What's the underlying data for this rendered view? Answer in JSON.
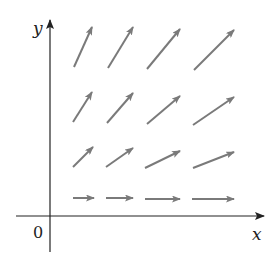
{
  "diagram": {
    "type": "vector-field",
    "labels": {
      "x_axis": "x",
      "y_axis": "y",
      "origin": "0"
    },
    "colors": {
      "axis": "#222222",
      "arrow": "#7a7a7a",
      "background": "#ffffff"
    },
    "axes": {
      "x_axis": {
        "x1": 16,
        "y1": 216,
        "x2": 264,
        "y2": 216
      },
      "y_axis": {
        "x1": 50,
        "y1": 252,
        "x2": 50,
        "y2": 20
      }
    },
    "arrows": [
      {
        "row": 1,
        "col": 1,
        "x1": 73,
        "y1": 198,
        "x2": 94,
        "y2": 198
      },
      {
        "row": 1,
        "col": 2,
        "x1": 106,
        "y1": 198,
        "x2": 133,
        "y2": 198
      },
      {
        "row": 1,
        "col": 3,
        "x1": 145,
        "y1": 199,
        "x2": 180,
        "y2": 199
      },
      {
        "row": 1,
        "col": 4,
        "x1": 192,
        "y1": 199,
        "x2": 234,
        "y2": 199
      },
      {
        "row": 2,
        "col": 1,
        "x1": 73,
        "y1": 167,
        "x2": 93,
        "y2": 147
      },
      {
        "row": 2,
        "col": 2,
        "x1": 106,
        "y1": 167,
        "x2": 133,
        "y2": 148
      },
      {
        "row": 2,
        "col": 3,
        "x1": 145,
        "y1": 168,
        "x2": 180,
        "y2": 151
      },
      {
        "row": 2,
        "col": 4,
        "x1": 193,
        "y1": 168,
        "x2": 234,
        "y2": 152
      },
      {
        "row": 3,
        "col": 1,
        "x1": 73,
        "y1": 122,
        "x2": 92,
        "y2": 92
      },
      {
        "row": 3,
        "col": 2,
        "x1": 107,
        "y1": 123,
        "x2": 133,
        "y2": 93
      },
      {
        "row": 3,
        "col": 3,
        "x1": 147,
        "y1": 124,
        "x2": 180,
        "y2": 96
      },
      {
        "row": 3,
        "col": 4,
        "x1": 193,
        "y1": 125,
        "x2": 234,
        "y2": 97
      },
      {
        "row": 4,
        "col": 1,
        "x1": 74,
        "y1": 67,
        "x2": 92,
        "y2": 27
      },
      {
        "row": 4,
        "col": 2,
        "x1": 108,
        "y1": 68,
        "x2": 133,
        "y2": 27
      },
      {
        "row": 4,
        "col": 3,
        "x1": 147,
        "y1": 69,
        "x2": 180,
        "y2": 29
      },
      {
        "row": 4,
        "col": 4,
        "x1": 194,
        "y1": 70,
        "x2": 234,
        "y2": 30
      }
    ]
  }
}
